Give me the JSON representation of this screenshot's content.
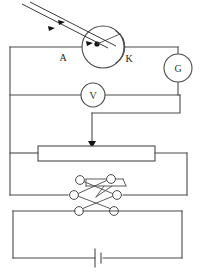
{
  "diagram": {
    "type": "schematic",
    "background_color": "#ffffff",
    "wire_color": "#4a4a4a",
    "ink_color": "#222222",
    "width": 202,
    "height": 276
  },
  "labels": {
    "anode": "A",
    "cathode": "K",
    "galvanometer": "G",
    "voltmeter": "V"
  },
  "components": [
    {
      "name": "phototube",
      "kind": "photoelectric-tube",
      "electrodes": [
        "A",
        "K"
      ],
      "center": [
        103,
        47
      ],
      "radius": 21
    },
    {
      "name": "galvanometer",
      "kind": "meter",
      "label": "G",
      "center": [
        178,
        68
      ],
      "radius": 14
    },
    {
      "name": "voltmeter",
      "kind": "meter",
      "label": "V",
      "center": [
        93,
        95
      ],
      "radius": 12
    },
    {
      "name": "rheostat",
      "kind": "potentiometer",
      "box": [
        38,
        146,
        117,
        15
      ],
      "slider_x": 92
    },
    {
      "name": "reversing-switch",
      "kind": "dpdt-commutator",
      "terminal_count": 6
    },
    {
      "name": "battery",
      "kind": "cell",
      "center": [
        99,
        258
      ]
    }
  ],
  "light_beam": {
    "name": "incident-light",
    "arrow_count": 3,
    "direction": "down-right"
  }
}
